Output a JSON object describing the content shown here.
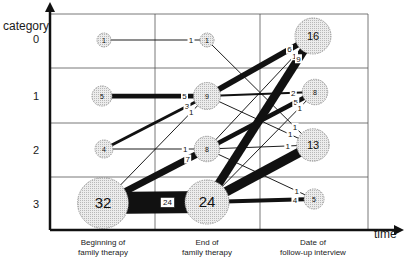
{
  "axes": {
    "y_label": "category",
    "x_label": "time",
    "y_ticks": [
      "0",
      "1",
      "2",
      "3"
    ],
    "x_ticks": [
      {
        "line1": "Beginning of",
        "line2": "family therapy"
      },
      {
        "line1": "End of",
        "line2": "family therapy"
      },
      {
        "line1": "Date of",
        "line2": "follow-up interview"
      }
    ]
  },
  "colors": {
    "line": "#111111",
    "node_fill": "#e4e4e4",
    "node_stroke": "#888888",
    "grid": "#555555"
  },
  "nodes": [
    {
      "id": "b0",
      "time": 0,
      "category": 0,
      "count": 1
    },
    {
      "id": "b1",
      "time": 0,
      "category": 1,
      "count": 5
    },
    {
      "id": "b2",
      "time": 0,
      "category": 2,
      "count": 4
    },
    {
      "id": "b3",
      "time": 0,
      "category": 3,
      "count": 32
    },
    {
      "id": "e0",
      "time": 1,
      "category": 0,
      "count": 1
    },
    {
      "id": "e1",
      "time": 1,
      "category": 1,
      "count": 9
    },
    {
      "id": "e2",
      "time": 1,
      "category": 2,
      "count": 8
    },
    {
      "id": "e3",
      "time": 1,
      "category": 3,
      "count": 24
    },
    {
      "id": "f0",
      "time": 2,
      "category": 0,
      "count": 16
    },
    {
      "id": "f1",
      "time": 2,
      "category": 1,
      "count": 8
    },
    {
      "id": "f2",
      "time": 2,
      "category": 2,
      "count": 13
    },
    {
      "id": "f3",
      "time": 2,
      "category": 3,
      "count": 5
    }
  ],
  "edges": [
    {
      "from": "b0",
      "to": "e0",
      "count": 1
    },
    {
      "from": "b1",
      "to": "e1",
      "count": 5
    },
    {
      "from": "b2",
      "to": "e1",
      "count": 3
    },
    {
      "from": "b3",
      "to": "e1",
      "count": 1
    },
    {
      "from": "b2",
      "to": "e2",
      "count": 1
    },
    {
      "from": "b3",
      "to": "e2",
      "count": 7
    },
    {
      "from": "b3",
      "to": "e3",
      "count": 24
    },
    {
      "from": "e0",
      "to": "f2",
      "count": 1
    },
    {
      "from": "e1",
      "to": "f0",
      "count": 6
    },
    {
      "from": "e1",
      "to": "f1",
      "count": 2
    },
    {
      "from": "e1",
      "to": "f2",
      "count": 1
    },
    {
      "from": "e2",
      "to": "f0",
      "count": 1
    },
    {
      "from": "e2",
      "to": "f1",
      "count": 5
    },
    {
      "from": "e2",
      "to": "f2",
      "count": 1
    },
    {
      "from": "e2",
      "to": "f3",
      "count": 1
    },
    {
      "from": "e3",
      "to": "f0",
      "count": 9
    },
    {
      "from": "e3",
      "to": "f1",
      "count": 1
    },
    {
      "from": "e3",
      "to": "f2",
      "count": 10
    },
    {
      "from": "e3",
      "to": "f3",
      "count": 4
    }
  ]
}
